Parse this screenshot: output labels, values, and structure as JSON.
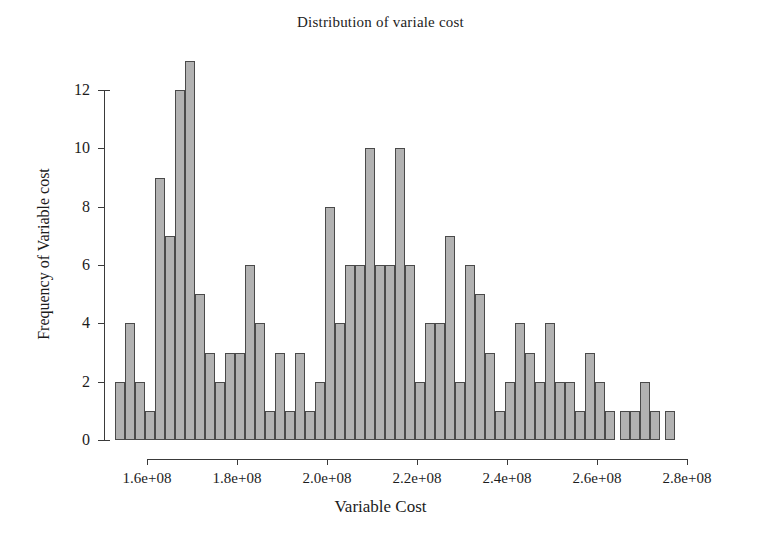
{
  "chart_data": {
    "type": "bar",
    "subtype": "histogram",
    "title": "Distribution of variale cost",
    "xlabel": "Variable Cost",
    "ylabel": "Frequency of Variable cost",
    "xlim": [
      155000000,
      283000000
    ],
    "ylim": [
      0,
      13
    ],
    "grid": false,
    "legend": null,
    "bar_color": "#b2b2b2",
    "bar_edge_color": "#4a4a4a",
    "background_color": "#ffffff",
    "bin_width": 2222222,
    "x_ticks": [
      {
        "value": 160000000,
        "label": "1.6e+08",
        "px": 147
      },
      {
        "value": 180000000,
        "label": "1.8e+08",
        "px": 237
      },
      {
        "value": 200000000,
        "label": "2.0e+08",
        "px": 327
      },
      {
        "value": 220000000,
        "label": "2.2e+08",
        "px": 417
      },
      {
        "value": 240000000,
        "label": "2.4e+08",
        "px": 507
      },
      {
        "value": 260000000,
        "label": "2.6e+08",
        "px": 597
      },
      {
        "value": 280000000,
        "label": "2.8e+08",
        "px": 687
      }
    ],
    "y_ticks": [
      {
        "value": 0,
        "label": "0"
      },
      {
        "value": 2,
        "label": "2"
      },
      {
        "value": 4,
        "label": "4"
      },
      {
        "value": 6,
        "label": "6"
      },
      {
        "value": 8,
        "label": "8"
      },
      {
        "value": 10,
        "label": "10"
      },
      {
        "value": 12,
        "label": "12"
      }
    ],
    "bins": [
      {
        "index": 0,
        "left_px": 115,
        "bin_center": 157000000,
        "value": 2
      },
      {
        "index": 1,
        "left_px": 125,
        "bin_center": 159200000,
        "value": 4
      },
      {
        "index": 2,
        "left_px": 135,
        "bin_center": 161400000,
        "value": 2
      },
      {
        "index": 3,
        "left_px": 145,
        "bin_center": 163600000,
        "value": 1
      },
      {
        "index": 4,
        "left_px": 155,
        "bin_center": 165800000,
        "value": 9
      },
      {
        "index": 5,
        "left_px": 165,
        "bin_center": 168000000,
        "value": 7
      },
      {
        "index": 6,
        "left_px": 175,
        "bin_center": 170200000,
        "value": 12
      },
      {
        "index": 7,
        "left_px": 185,
        "bin_center": 172400000,
        "value": 13
      },
      {
        "index": 8,
        "left_px": 195,
        "bin_center": 174600000,
        "value": 5
      },
      {
        "index": 9,
        "left_px": 205,
        "bin_center": 176800000,
        "value": 3
      },
      {
        "index": 10,
        "left_px": 215,
        "bin_center": 179000000,
        "value": 2
      },
      {
        "index": 11,
        "left_px": 225,
        "bin_center": 181200000,
        "value": 3
      },
      {
        "index": 12,
        "left_px": 235,
        "bin_center": 183400000,
        "value": 3
      },
      {
        "index": 13,
        "left_px": 245,
        "bin_center": 185600000,
        "value": 6
      },
      {
        "index": 14,
        "left_px": 255,
        "bin_center": 187800000,
        "value": 4
      },
      {
        "index": 15,
        "left_px": 265,
        "bin_center": 190000000,
        "value": 1
      },
      {
        "index": 16,
        "left_px": 275,
        "bin_center": 192200000,
        "value": 3
      },
      {
        "index": 17,
        "left_px": 285,
        "bin_center": 194400000,
        "value": 1
      },
      {
        "index": 18,
        "left_px": 295,
        "bin_center": 196600000,
        "value": 3
      },
      {
        "index": 19,
        "left_px": 305,
        "bin_center": 198800000,
        "value": 1
      },
      {
        "index": 20,
        "left_px": 315,
        "bin_center": 201000000,
        "value": 2
      },
      {
        "index": 21,
        "left_px": 325,
        "bin_center": 203200000,
        "value": 8
      },
      {
        "index": 22,
        "left_px": 335,
        "bin_center": 205400000,
        "value": 4
      },
      {
        "index": 23,
        "left_px": 345,
        "bin_center": 207600000,
        "value": 6
      },
      {
        "index": 24,
        "left_px": 355,
        "bin_center": 209800000,
        "value": 6
      },
      {
        "index": 25,
        "left_px": 365,
        "bin_center": 212000000,
        "value": 10
      },
      {
        "index": 26,
        "left_px": 375,
        "bin_center": 214200000,
        "value": 6
      },
      {
        "index": 27,
        "left_px": 385,
        "bin_center": 216400000,
        "value": 6
      },
      {
        "index": 28,
        "left_px": 395,
        "bin_center": 218600000,
        "value": 10
      },
      {
        "index": 29,
        "left_px": 405,
        "bin_center": 220800000,
        "value": 6
      },
      {
        "index": 30,
        "left_px": 415,
        "bin_center": 223000000,
        "value": 2
      },
      {
        "index": 31,
        "left_px": 425,
        "bin_center": 225200000,
        "value": 4
      },
      {
        "index": 32,
        "left_px": 435,
        "bin_center": 227400000,
        "value": 4
      },
      {
        "index": 33,
        "left_px": 445,
        "bin_center": 229600000,
        "value": 7
      },
      {
        "index": 34,
        "left_px": 455,
        "bin_center": 231800000,
        "value": 2
      },
      {
        "index": 35,
        "left_px": 465,
        "bin_center": 234000000,
        "value": 6
      },
      {
        "index": 36,
        "left_px": 475,
        "bin_center": 236200000,
        "value": 5
      },
      {
        "index": 37,
        "left_px": 485,
        "bin_center": 238400000,
        "value": 3
      },
      {
        "index": 38,
        "left_px": 495,
        "bin_center": 240600000,
        "value": 1
      },
      {
        "index": 39,
        "left_px": 505,
        "bin_center": 242800000,
        "value": 2
      },
      {
        "index": 40,
        "left_px": 515,
        "bin_center": 245000000,
        "value": 4
      },
      {
        "index": 41,
        "left_px": 525,
        "bin_center": 247200000,
        "value": 3
      },
      {
        "index": 42,
        "left_px": 535,
        "bin_center": 249400000,
        "value": 2
      },
      {
        "index": 43,
        "left_px": 545,
        "bin_center": 251600000,
        "value": 4
      },
      {
        "index": 44,
        "left_px": 555,
        "bin_center": 253800000,
        "value": 2
      },
      {
        "index": 45,
        "left_px": 565,
        "bin_center": 256000000,
        "value": 2
      },
      {
        "index": 46,
        "left_px": 575,
        "bin_center": 258200000,
        "value": 1
      },
      {
        "index": 47,
        "left_px": 585,
        "bin_center": 260400000,
        "value": 3
      },
      {
        "index": 48,
        "left_px": 595,
        "bin_center": 262600000,
        "value": 2
      },
      {
        "index": 49,
        "left_px": 605,
        "bin_center": 264800000,
        "value": 1
      },
      {
        "index": 50,
        "left_px": 620,
        "bin_center": 268000000,
        "value": 1
      },
      {
        "index": 51,
        "left_px": 630,
        "bin_center": 270200000,
        "value": 1
      },
      {
        "index": 52,
        "left_px": 640,
        "bin_center": 272400000,
        "value": 2
      },
      {
        "index": 53,
        "left_px": 650,
        "bin_center": 274600000,
        "value": 1
      },
      {
        "index": 54,
        "left_px": 665,
        "bin_center": 277800000,
        "value": 1
      }
    ]
  }
}
